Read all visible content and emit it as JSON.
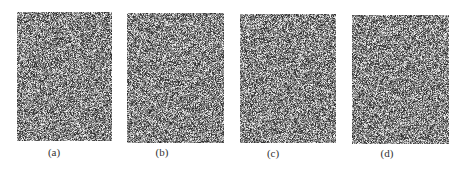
{
  "figure": {
    "panels": [
      {
        "id": "a",
        "caption": "(a)",
        "x": 17,
        "y": 12,
        "w": 95,
        "h": 129,
        "cap_x": 48,
        "cap_y": 146,
        "seed": 11
      },
      {
        "id": "b",
        "caption": "(b)",
        "x": 127,
        "y": 13,
        "w": 97,
        "h": 130,
        "cap_x": 156,
        "cap_y": 146,
        "seed": 23
      },
      {
        "id": "c",
        "caption": "(c)",
        "x": 240,
        "y": 14,
        "w": 96,
        "h": 129,
        "cap_x": 267,
        "cap_y": 147,
        "seed": 37
      },
      {
        "id": "d",
        "caption": "(d)",
        "x": 352,
        "y": 15,
        "w": 97,
        "h": 129,
        "cap_x": 381,
        "cap_y": 147,
        "seed": 53
      }
    ],
    "content": "random-noise-image",
    "noise_colors": {
      "dark": "#2a2a2a",
      "mid": "#7a7a7a",
      "light": "#d8d8d8"
    }
  }
}
